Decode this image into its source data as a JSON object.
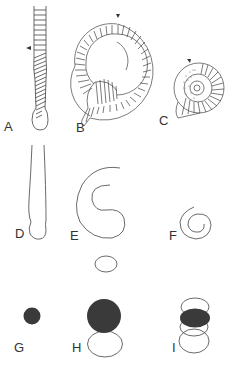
{
  "figure": {
    "panels": [
      {
        "id": "A",
        "label": "A",
        "description": "straight tube with transverse ribs, oblique striations near base, arrow marking"
      },
      {
        "id": "B",
        "label": "B",
        "description": "coiled ribbed shell, arrow at top"
      },
      {
        "id": "C",
        "label": "C",
        "description": "ammonite-like spiral shell with stippled inner whorls, arrow at top"
      },
      {
        "id": "D",
        "label": "D",
        "description": "outline of straight tube"
      },
      {
        "id": "E",
        "label": "E",
        "description": "outline of open coiled spiral"
      },
      {
        "id": "F",
        "label": "F",
        "description": "outline of tight small spiral"
      },
      {
        "id": "G",
        "label": "G",
        "description": "small dark circular section"
      },
      {
        "id": "H",
        "label": "H",
        "description": "large dark circular section with open ellipse below and small ellipse above"
      },
      {
        "id": "I",
        "label": "I",
        "description": "dark ellipse among stacked open ellipses"
      }
    ],
    "colors": {
      "line": "#444444",
      "fill_dark": "#3a3a3a",
      "background": "#ffffff"
    }
  }
}
